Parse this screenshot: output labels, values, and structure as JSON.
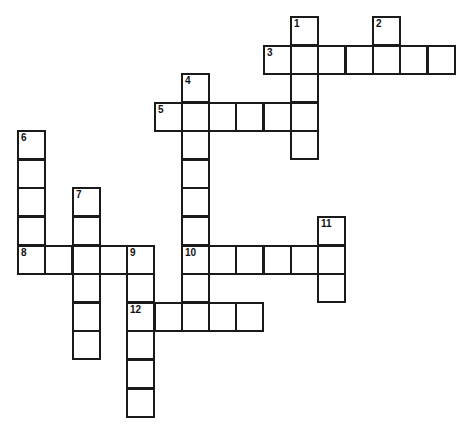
{
  "puzzle": {
    "cell_size": 27.3,
    "origin_x": 17,
    "origin_y": 16,
    "line_color": "#1a1a1a",
    "words": [
      {
        "number": "1",
        "direction": "down",
        "row": 0,
        "col": 10,
        "length": 5
      },
      {
        "number": "2",
        "direction": "down",
        "row": 0,
        "col": 13,
        "length": 2
      },
      {
        "number": "3",
        "direction": "across",
        "row": 1,
        "col": 9,
        "length": 7
      },
      {
        "number": "4",
        "direction": "down",
        "row": 2,
        "col": 6,
        "length": 9
      },
      {
        "number": "5",
        "direction": "across",
        "row": 3,
        "col": 5,
        "length": 6
      },
      {
        "number": "6",
        "direction": "down",
        "row": 4,
        "col": 0,
        "length": 5
      },
      {
        "number": "7",
        "direction": "down",
        "row": 6,
        "col": 2,
        "length": 6
      },
      {
        "number": "8",
        "direction": "across",
        "row": 8,
        "col": 0,
        "length": 5
      },
      {
        "number": "9",
        "direction": "down",
        "row": 8,
        "col": 4,
        "length": 6
      },
      {
        "number": "10",
        "direction": "across",
        "row": 8,
        "col": 6,
        "length": 6
      },
      {
        "number": "11",
        "direction": "down",
        "row": 7,
        "col": 11,
        "length": 3
      },
      {
        "number": "12",
        "direction": "across",
        "row": 10,
        "col": 4,
        "length": 5
      }
    ]
  }
}
